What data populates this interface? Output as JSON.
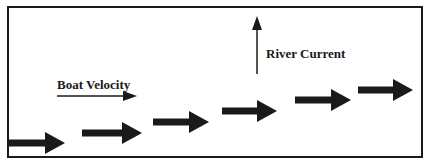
{
  "diagram": {
    "labels": {
      "boat_velocity": "Boat Velocity",
      "river_current": "River Current"
    },
    "colors": {
      "ink": "#1a1a1a",
      "background": "#ffffff"
    },
    "boat_path_arrows": [
      {
        "x1": 8,
        "x2": 65,
        "y": 143
      },
      {
        "x1": 82,
        "x2": 142,
        "y": 133
      },
      {
        "x1": 153,
        "x2": 209,
        "y": 122
      },
      {
        "x1": 222,
        "x2": 277,
        "y": 111
      },
      {
        "x1": 295,
        "x2": 351,
        "y": 100
      },
      {
        "x1": 358,
        "x2": 413,
        "y": 90
      }
    ],
    "boat_velocity_vector": {
      "x1": 57,
      "x2": 137,
      "y": 96
    },
    "river_current_vector": {
      "x": 257,
      "y1": 74,
      "y2": 16
    }
  }
}
